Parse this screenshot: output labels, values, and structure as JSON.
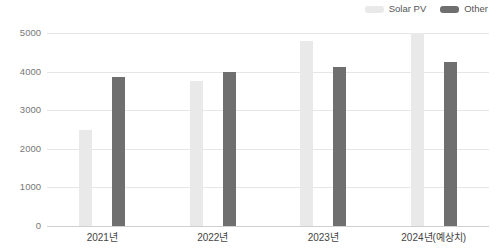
{
  "legend": {
    "position": "top-right",
    "items": [
      {
        "label": "Solar PV",
        "color": "#e9e9e9",
        "swatch_name": "legend-swatch-solar-pv"
      },
      {
        "label": "Other",
        "color": "#6f6f6f",
        "swatch_name": "legend-swatch-other"
      }
    ]
  },
  "axes": {
    "y_ticks": [
      "5000",
      "4000",
      "3000",
      "2000",
      "1000",
      "0"
    ],
    "x_ticks": [
      "2021년",
      "2022년",
      "2023년",
      "2024년(예상치)"
    ]
  },
  "chart_data": {
    "type": "bar",
    "title": "",
    "subtitle": "",
    "xlabel": "",
    "ylabel": "",
    "categories": [
      "2021년",
      "2022년",
      "2023년",
      "2024년(예상치)"
    ],
    "series": [
      {
        "name": "Solar PV",
        "color": "#e9e9e9",
        "values": [
          2500,
          3750,
          4800,
          5000
        ]
      },
      {
        "name": "Other",
        "color": "#6f6f6f",
        "values": [
          3850,
          4000,
          4120,
          4250
        ]
      }
    ],
    "ylim": [
      0,
      5000
    ],
    "y_tick_values": [
      0,
      1000,
      2000,
      3000,
      4000,
      5000
    ],
    "grid": true,
    "grid_axis": "y",
    "legend_position": "top-right",
    "annotations": []
  }
}
